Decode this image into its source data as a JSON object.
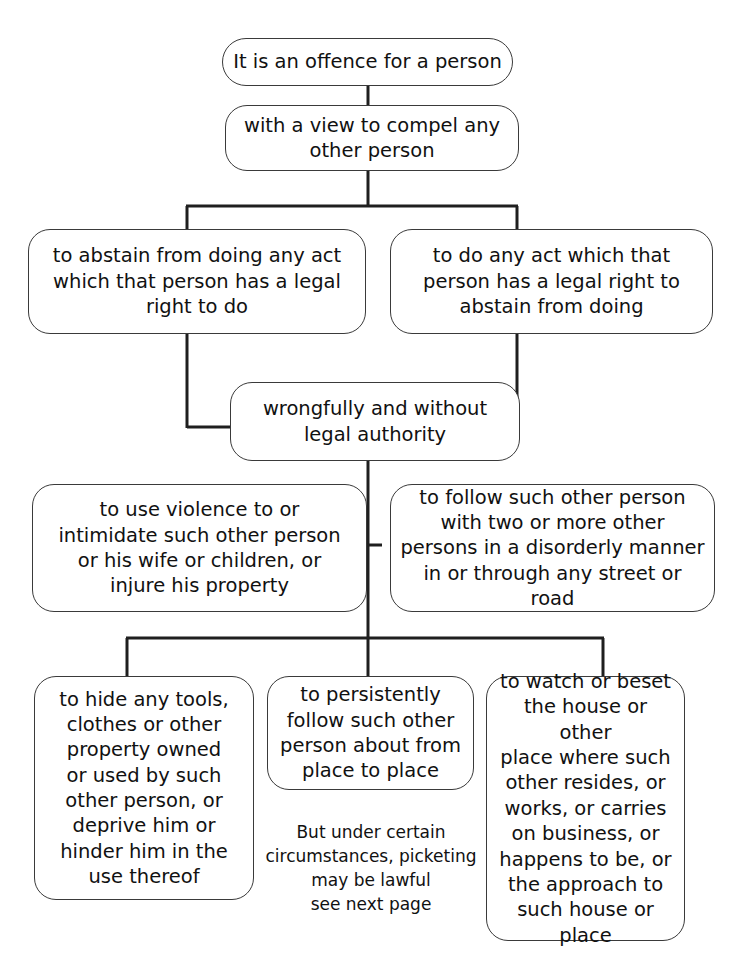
{
  "diagram": {
    "title": "It is an offence for a person",
    "line_color": "#1f1f1f",
    "box_border_color": "#3a3a3a",
    "background": "#ffffff",
    "nodes": {
      "top": "It is an offence for a person",
      "view": "with a view to compel any\nother person",
      "abstain": "to abstain from doing any act\nwhich that person has a legal\nright to do",
      "do_act": "to do any act which that\nperson has a legal right to\nabstain from doing",
      "wrongful": "wrongfully and without\nlegal authority",
      "violence": "to use violence to or\nintimidate such other person\nor his wife or children, or\ninjure his property",
      "follow_two": "to follow such other person\nwith two or more other\npersons in a disorderly manner\nin or through any street or road",
      "hide": "to hide any tools,\nclothes or other\nproperty owned\nor used by such\nother person, or\ndeprive him or\nhinder him in the\nuse thereof",
      "persist": "to persistently\nfollow such other\nperson about from\nplace to place",
      "watch": "to watch or beset\nthe house or other\nplace where such\nother resides, or\nworks, or carries\non business, or\nhappens to be, or\nthe approach to\nsuch house or\nplace"
    },
    "note": "But under certain\ncircumstances, picketing\nmay be lawful\nsee next page"
  }
}
